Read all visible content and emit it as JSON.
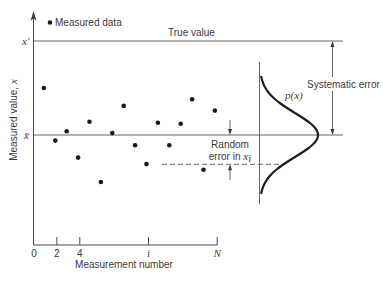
{
  "figure": {
    "legend_label": "Measured data",
    "true_value_label": "True value",
    "x_prime_label": "x′",
    "x_bar_label": "x̄",
    "y_axis_label": "Measured value, ",
    "y_axis_symbol": "x",
    "x_axis_label": "Measurement number",
    "systematic_error_label": "Systematic error",
    "pdf_label": "p(x)",
    "random_error_line1": "Random",
    "random_error_line2": "error in ",
    "random_error_symbol": "x",
    "random_error_subscript": "i",
    "ticks": [
      {
        "label": "0",
        "index": 0
      },
      {
        "label": "2",
        "index": 2
      },
      {
        "label": "4",
        "index": 4
      },
      {
        "label": "i",
        "index": 10
      },
      {
        "label": "N",
        "index": 16
      }
    ],
    "colors": {
      "line": "#4a4a4a",
      "dot": "#1a1a1a",
      "curve": "#1e1e1e",
      "text": "#3a3a3a"
    }
  },
  "chart_data": {
    "type": "scatter",
    "title": "",
    "xlabel": "Measurement number",
    "ylabel": "Measured value, x",
    "legend": [
      "Measured data"
    ],
    "x": [
      1,
      2,
      3,
      4,
      5,
      6,
      7,
      8,
      9,
      10,
      11,
      12,
      13,
      14,
      15,
      16
    ],
    "values_note": "relative units: mean x̄ = 0, true value x′ = 1",
    "values": [
      0.5,
      -0.06,
      0.04,
      -0.24,
      0.14,
      -0.5,
      0.02,
      0.31,
      -0.11,
      -0.31,
      0.13,
      -0.11,
      0.12,
      0.38,
      -0.37,
      0.26
    ],
    "reference_lines": [
      {
        "name": "True value",
        "symbol": "x′",
        "value": 1.0
      },
      {
        "name": "Mean",
        "symbol": "x̄",
        "value": 0.0
      }
    ],
    "highlighted_point": {
      "index": 10,
      "label": "i",
      "value": -0.31,
      "annotation": "Random error in x_i"
    },
    "annotations": [
      "Systematic error (x′ − x̄)",
      "Random error in x_i",
      "p(x)"
    ],
    "distribution": {
      "type": "normal",
      "mean": 0.0,
      "sigma": 0.234,
      "label": "p(x)"
    },
    "x_ticks": [
      "0",
      "2",
      "4",
      "i",
      "N"
    ],
    "grid": false,
    "legend_position": "top-left"
  }
}
